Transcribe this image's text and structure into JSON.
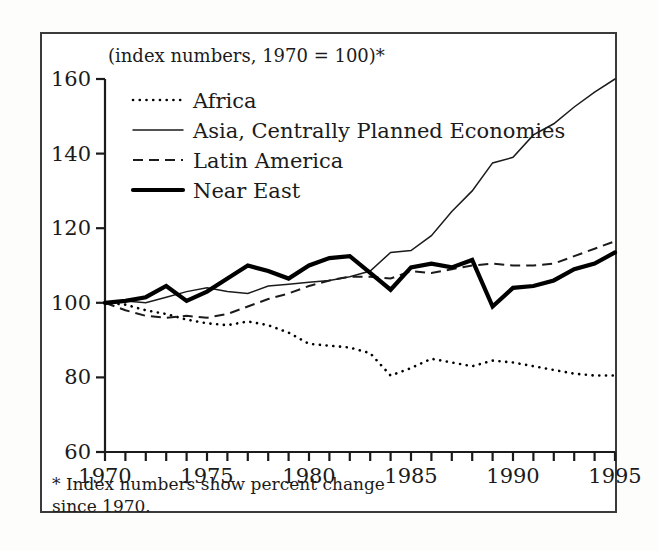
{
  "figure": {
    "subtitle": "(index numbers, 1970 = 100)*",
    "footnote_line1": "* Index numbers show percent change",
    "footnote_line2": "since 1970."
  },
  "chart_data": {
    "type": "line",
    "title": "",
    "subtitle": "(index numbers, 1970 = 100)*",
    "xlabel": "",
    "ylabel": "",
    "xlim": [
      1970,
      1995
    ],
    "ylim": [
      60,
      160
    ],
    "yticks": [
      60,
      80,
      100,
      120,
      140,
      160
    ],
    "ytick_labels": [
      "60",
      "80",
      "100",
      "120",
      "140",
      "160"
    ],
    "xticks": [
      1970,
      1971,
      1972,
      1973,
      1974,
      1975,
      1976,
      1977,
      1978,
      1979,
      1980,
      1981,
      1982,
      1983,
      1984,
      1985,
      1986,
      1987,
      1988,
      1989,
      1990,
      1991,
      1992,
      1993,
      1994,
      1995
    ],
    "xtick_labels_shown": [
      "1970",
      "1975",
      "1980",
      "1985",
      "1990",
      "1995"
    ],
    "xtick_labels_shown_at": [
      1970,
      1975,
      1980,
      1985,
      1990,
      1995
    ],
    "grid": false,
    "legend_position": "upper-left-inside",
    "x": [
      1970,
      1971,
      1972,
      1973,
      1974,
      1975,
      1976,
      1977,
      1978,
      1979,
      1980,
      1981,
      1982,
      1983,
      1984,
      1985,
      1986,
      1987,
      1988,
      1989,
      1990,
      1991,
      1992,
      1993,
      1994,
      1995
    ],
    "series": [
      {
        "name": "Africa",
        "style": "dotted",
        "color": "#000000",
        "width": 2.6,
        "values": [
          100,
          99.5,
          98,
          97,
          95.5,
          94.5,
          94,
          95,
          94,
          92,
          89,
          88.5,
          88,
          86.5,
          80.5,
          82.5,
          85,
          84,
          83,
          84.5,
          84,
          83,
          82,
          81,
          80.5,
          80.5
        ]
      },
      {
        "name": "Asia, Centrally Planned Economies",
        "style": "solid-thin",
        "color": "#1b1b1b",
        "width": 1.5,
        "values": [
          100,
          100.5,
          100,
          101.5,
          103,
          104,
          103,
          102.5,
          104.5,
          105,
          105.5,
          106,
          107,
          108.5,
          113.5,
          114,
          118,
          124.5,
          130,
          137.5,
          139,
          145,
          148,
          152.5,
          156.5,
          160
        ]
      },
      {
        "name": "Latin America",
        "style": "dashed",
        "color": "#1b1b1b",
        "width": 2.0,
        "values": [
          100,
          98,
          96.5,
          96,
          96.5,
          96,
          97,
          99,
          101,
          102.5,
          104.5,
          106,
          107,
          107,
          106.5,
          108.5,
          108,
          109,
          110,
          110.5,
          110,
          110,
          110.5,
          112.5,
          114.5,
          116.5
        ]
      },
      {
        "name": "Near East",
        "style": "solid-thick",
        "color": "#000000",
        "width": 4.2,
        "values": [
          100,
          100.5,
          101.5,
          104.5,
          100.5,
          103,
          106.5,
          110,
          108.5,
          106.5,
          110,
          112,
          112.5,
          108,
          103.5,
          109.5,
          110.5,
          109.5,
          111.5,
          99,
          104,
          104.5,
          106,
          109,
          110.5,
          113.5
        ]
      }
    ],
    "legend": [
      {
        "label": "Africa",
        "style": "dotted"
      },
      {
        "label": "Asia, Centrally Planned Economies",
        "style": "solid-thin"
      },
      {
        "label": "Latin America",
        "style": "dashed"
      },
      {
        "label": "Near East",
        "style": "solid-thick"
      }
    ]
  }
}
